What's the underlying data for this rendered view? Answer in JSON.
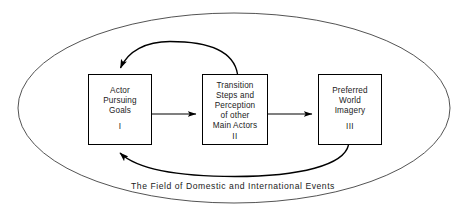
{
  "diagram": {
    "title": "The Field of Domestic and International Events",
    "caption": "The Field of Domestic and International Events",
    "stroke_color": "#000000",
    "ellipse_stroke_color": "#3a3a3a",
    "background_color": "#ffffff",
    "boxes": [
      {
        "id": "box-1",
        "numeral": "I",
        "lines": [
          "Actor",
          "Pursuing",
          "Goals"
        ],
        "text": "Actor Pursuing Goals"
      },
      {
        "id": "box-2",
        "numeral": "II",
        "lines": [
          "Transition",
          "Steps and",
          "Perception",
          "of other",
          "Main Actors"
        ],
        "text": "Transition Steps and Perception of other Main Actors"
      },
      {
        "id": "box-3",
        "numeral": "III",
        "lines": [
          "Preferred",
          "World",
          "Imagery"
        ],
        "text": "Preferred World Imagery"
      }
    ],
    "connectors": [
      {
        "id": "arrow-1-to-2",
        "from": "box-1",
        "to": "box-2",
        "style": "straight",
        "direction": "right"
      },
      {
        "id": "arrow-2-to-3",
        "from": "box-2",
        "to": "box-3",
        "style": "straight",
        "direction": "right"
      },
      {
        "id": "feedback-2-to-1",
        "from": "box-2",
        "to": "box-1",
        "style": "curved-above",
        "direction": "left"
      },
      {
        "id": "feedback-3-to-1",
        "from": "box-3",
        "to": "box-1",
        "style": "curved-below",
        "direction": "left"
      }
    ],
    "enclosure": {
      "shape": "ellipse",
      "label": "The Field of Domestic and International Events"
    }
  }
}
